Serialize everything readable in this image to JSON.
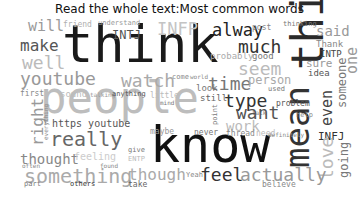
{
  "title": "Read the whole text:Most common words",
  "words": [
    {
      "text": "think",
      "x": 62,
      "y": 18,
      "size": 52,
      "color": "#1a1a1a",
      "rot": 0
    },
    {
      "text": "people",
      "x": 40,
      "y": 76,
      "size": 44,
      "color": "#bdbdbd",
      "rot": 0
    },
    {
      "text": "know",
      "x": 150,
      "y": 120,
      "size": 50,
      "color": "#111111",
      "rot": 0
    },
    {
      "text": "thing",
      "x": 286,
      "y": 70,
      "size": 44,
      "color": "#2a2a2a",
      "rot": -90
    },
    {
      "text": "mean",
      "x": 280,
      "y": 168,
      "size": 34,
      "color": "#333333",
      "rot": -90
    },
    {
      "text": "will",
      "x": 28,
      "y": 19,
      "size": 15,
      "color": "#9a9a9a",
      "rot": 0
    },
    {
      "text": "friend",
      "x": 63,
      "y": 21,
      "size": 8,
      "color": "#b0b0b0",
      "rot": 0
    },
    {
      "text": "understand",
      "x": 98,
      "y": 20,
      "size": 7,
      "color": "#9a9a9a",
      "rot": 0
    },
    {
      "text": "INTJ",
      "x": 112,
      "y": 29,
      "size": 12,
      "color": "#555555",
      "rot": 0
    },
    {
      "text": "INFP",
      "x": 157,
      "y": 21,
      "size": 17,
      "color": "#c4c4c4",
      "rot": 0
    },
    {
      "text": "alway",
      "x": 212,
      "y": 22,
      "size": 17,
      "color": "#222222",
      "rot": 0
    },
    {
      "text": "post",
      "x": 252,
      "y": 24,
      "size": 8,
      "color": "#888888",
      "rot": 0
    },
    {
      "text": "thinking",
      "x": 283,
      "y": 21,
      "size": 7,
      "color": "#777777",
      "rot": 0
    },
    {
      "text": "said",
      "x": 316,
      "y": 24,
      "size": 14,
      "color": "#999999",
      "rot": 0
    },
    {
      "text": "make",
      "x": 20,
      "y": 38,
      "size": 16,
      "color": "#555555",
      "rot": 0
    },
    {
      "text": "much",
      "x": 238,
      "y": 38,
      "size": 18,
      "color": "#333333",
      "rot": 0
    },
    {
      "text": "Thank",
      "x": 316,
      "y": 40,
      "size": 9,
      "color": "#888888",
      "rot": 0
    },
    {
      "text": "probably",
      "x": 210,
      "y": 52,
      "size": 9,
      "color": "#aaaaaa",
      "rot": 0
    },
    {
      "text": "good",
      "x": 252,
      "y": 52,
      "size": 9,
      "color": "#777777",
      "rot": 0
    },
    {
      "text": "INTP",
      "x": 320,
      "y": 50,
      "size": 9,
      "color": "#444444",
      "rot": 0
    },
    {
      "text": "well",
      "x": 22,
      "y": 54,
      "size": 18,
      "color": "#bbbbbb",
      "rot": 0
    },
    {
      "text": "seem",
      "x": 238,
      "y": 60,
      "size": 18,
      "color": "#bbbbbb",
      "rot": 0
    },
    {
      "text": "sure",
      "x": 306,
      "y": 58,
      "size": 11,
      "color": "#999999",
      "rot": 0
    },
    {
      "text": "idea",
      "x": 308,
      "y": 69,
      "size": 9,
      "color": "#555555",
      "rot": 0
    },
    {
      "text": "one",
      "x": 345,
      "y": 74,
      "size": 15,
      "color": "#999999",
      "rot": -90
    },
    {
      "text": "youtube",
      "x": 20,
      "y": 70,
      "size": 18,
      "color": "#999999",
      "rot": 0
    },
    {
      "text": "watch",
      "x": 121,
      "y": 72,
      "size": 18,
      "color": "#aaaaaa",
      "rot": 0
    },
    {
      "text": "time",
      "x": 208,
      "y": 75,
      "size": 18,
      "color": "#777777",
      "rot": 0
    },
    {
      "text": "person",
      "x": 248,
      "y": 74,
      "size": 12,
      "color": "#aaaaaa",
      "rot": 0
    },
    {
      "text": "first",
      "x": 20,
      "y": 90,
      "size": 8,
      "color": "#888888",
      "rot": 0
    },
    {
      "text": "sound",
      "x": 60,
      "y": 90,
      "size": 9,
      "color": "#bbbbbb",
      "rot": 0
    },
    {
      "text": "talking",
      "x": 90,
      "y": 92,
      "size": 6,
      "color": "#999999",
      "rot": 0
    },
    {
      "text": "anything",
      "x": 112,
      "y": 91,
      "size": 7,
      "color": "#555555",
      "rot": 0
    },
    {
      "text": "come",
      "x": 172,
      "y": 74,
      "size": 7,
      "color": "#888888",
      "rot": 0
    },
    {
      "text": "world",
      "x": 190,
      "y": 74,
      "size": 6,
      "color": "#888888",
      "rot": 0
    },
    {
      "text": "look",
      "x": 196,
      "y": 84,
      "size": 9,
      "color": "#777777",
      "rot": 0
    },
    {
      "text": "little",
      "x": 150,
      "y": 92,
      "size": 8,
      "color": "#bbbbbb",
      "rot": 0
    },
    {
      "text": "still",
      "x": 200,
      "y": 94,
      "size": 9,
      "color": "#666666",
      "rot": 0
    },
    {
      "text": "used",
      "x": 268,
      "y": 86,
      "size": 7,
      "color": "#777777",
      "rot": 0
    },
    {
      "text": "type",
      "x": 224,
      "y": 92,
      "size": 18,
      "color": "#333333",
      "rot": 0
    },
    {
      "text": "problem",
      "x": 276,
      "y": 100,
      "size": 8,
      "color": "#555555",
      "rot": 0
    },
    {
      "text": "even",
      "x": 320,
      "y": 126,
      "size": 15,
      "color": "#444444",
      "rot": -90
    },
    {
      "text": "someone",
      "x": 336,
      "y": 108,
      "size": 12,
      "color": "#777777",
      "rot": -90
    },
    {
      "text": "right",
      "x": 30,
      "y": 146,
      "size": 16,
      "color": "#999999",
      "rot": -90
    },
    {
      "text": "everything",
      "x": 43,
      "y": 140,
      "size": 6,
      "color": "#888888",
      "rot": -90
    },
    {
      "text": "mind",
      "x": 160,
      "y": 100,
      "size": 6,
      "color": "#777777",
      "rot": 0
    },
    {
      "text": "point",
      "x": 212,
      "y": 125,
      "size": 7,
      "color": "#777777",
      "rot": -90
    },
    {
      "text": "talk",
      "x": 252,
      "y": 110,
      "size": 6,
      "color": "#888888",
      "rot": 0
    },
    {
      "text": "want",
      "x": 236,
      "y": 104,
      "size": 18,
      "color": "#555555",
      "rot": 0
    },
    {
      "text": "help",
      "x": 296,
      "y": 112,
      "size": 7,
      "color": "#888888",
      "rot": 0
    },
    {
      "text": "https youtube",
      "x": 52,
      "y": 119,
      "size": 10,
      "color": "#555555",
      "rot": 0
    },
    {
      "text": "really",
      "x": 50,
      "y": 129,
      "size": 20,
      "color": "#666666",
      "rot": 0
    },
    {
      "text": "work",
      "x": 226,
      "y": 119,
      "size": 14,
      "color": "#bbbbbb",
      "rot": 0
    },
    {
      "text": "maybe",
      "x": 150,
      "y": 128,
      "size": 8,
      "color": "#999999",
      "rot": 0
    },
    {
      "text": "never",
      "x": 194,
      "y": 129,
      "size": 8,
      "color": "#777777",
      "rot": 0
    },
    {
      "text": "thread",
      "x": 226,
      "y": 130,
      "size": 8,
      "color": "#888888",
      "rot": 0
    },
    {
      "text": "need",
      "x": 256,
      "y": 130,
      "size": 8,
      "color": "#bbbbbb",
      "rot": 0
    },
    {
      "text": "definitely",
      "x": 268,
      "y": 132,
      "size": 6,
      "color": "#888888",
      "rot": 0
    },
    {
      "text": "INFJ",
      "x": 318,
      "y": 131,
      "size": 11,
      "color": "#333333",
      "rot": 0
    },
    {
      "text": "thought",
      "x": 20,
      "y": 152,
      "size": 14,
      "color": "#888888",
      "rot": 0
    },
    {
      "text": "feeling",
      "x": 74,
      "y": 152,
      "size": 10,
      "color": "#cccccc",
      "rot": 0
    },
    {
      "text": "give",
      "x": 128,
      "y": 147,
      "size": 7,
      "color": "#777777",
      "rot": 0
    },
    {
      "text": "ENTP",
      "x": 128,
      "y": 156,
      "size": 7,
      "color": "#bbbbbb",
      "rot": 0
    },
    {
      "text": "often",
      "x": 22,
      "y": 163,
      "size": 6,
      "color": "#888888",
      "rot": 0
    },
    {
      "text": "found",
      "x": 100,
      "y": 163,
      "size": 6,
      "color": "#888888",
      "rot": 0
    },
    {
      "text": "love",
      "x": 318,
      "y": 180,
      "size": 18,
      "color": "#bbbbbb",
      "rot": -90
    },
    {
      "text": "going",
      "x": 338,
      "y": 178,
      "size": 12,
      "color": "#777777",
      "rot": -90
    },
    {
      "text": "something",
      "x": 24,
      "y": 166,
      "size": 20,
      "color": "#aaaaaa",
      "rot": 0
    },
    {
      "text": "though",
      "x": 128,
      "y": 167,
      "size": 16,
      "color": "#aaaaaa",
      "rot": 0
    },
    {
      "text": "Yeah",
      "x": 186,
      "y": 172,
      "size": 7,
      "color": "#888888",
      "rot": 0
    },
    {
      "text": "feel",
      "x": 200,
      "y": 166,
      "size": 18,
      "color": "#333333",
      "rot": 0
    },
    {
      "text": "actually",
      "x": 240,
      "y": 166,
      "size": 18,
      "color": "#999999",
      "rot": 0
    },
    {
      "text": "part",
      "x": 24,
      "y": 181,
      "size": 7,
      "color": "#777777",
      "rot": 0
    },
    {
      "text": "others",
      "x": 70,
      "y": 181,
      "size": 7,
      "color": "#333333",
      "rot": 0
    },
    {
      "text": "take",
      "x": 128,
      "y": 181,
      "size": 8,
      "color": "#666666",
      "rot": 0
    },
    {
      "text": "believe",
      "x": 262,
      "y": 181,
      "size": 8,
      "color": "#888888",
      "rot": 0
    }
  ]
}
